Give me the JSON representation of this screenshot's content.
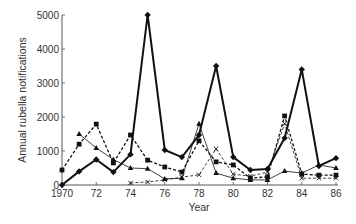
{
  "chart_data": {
    "type": "line",
    "title": "",
    "xlabel": "Year",
    "ylabel": "Annual rubella notifications",
    "xlim": [
      1970,
      1986
    ],
    "ylim": [
      0,
      5000
    ],
    "x_ticks": [
      1970,
      1972,
      1974,
      1976,
      1978,
      1980,
      1982,
      1984,
      1986
    ],
    "x_tick_labels": [
      "1970",
      "72",
      "74",
      "76",
      "78",
      "80",
      "82",
      "84",
      "86"
    ],
    "y_ticks": [
      0,
      1000,
      2000,
      3000,
      4000,
      5000
    ],
    "y_tick_labels": [
      "0",
      "1000",
      "2000",
      "3000",
      "4000",
      "5000"
    ],
    "grid": false,
    "legend": null,
    "x": [
      1970,
      1971,
      1972,
      1973,
      1974,
      1975,
      1976,
      1977,
      1978,
      1979,
      1980,
      1981,
      1982,
      1983,
      1984,
      1985,
      1986
    ],
    "series": [
      {
        "name": "diamond-solid-thick",
        "marker": "diamond",
        "line": "solid",
        "width": 2.0,
        "values": [
          0,
          400,
          750,
          380,
          900,
          5000,
          1030,
          820,
          1470,
          3500,
          820,
          440,
          470,
          1380,
          3400,
          560,
          790
        ]
      },
      {
        "name": "square-dashed",
        "marker": "square",
        "line": "dashed",
        "width": 1.3,
        "values": [
          440,
          1200,
          1790,
          650,
          1470,
          730,
          530,
          380,
          1300,
          680,
          590,
          200,
          240,
          2030,
          320,
          290,
          290
        ]
      },
      {
        "name": "triangle-solid-thin",
        "marker": "triangle",
        "line": "solid",
        "width": 0.8,
        "values": [
          null,
          1500,
          1090,
          750,
          500,
          480,
          180,
          200,
          1800,
          350,
          200,
          150,
          150,
          410,
          350,
          590,
          500
        ]
      },
      {
        "name": "cross-dashed-thin",
        "marker": "cross",
        "line": "dashed",
        "width": 0.8,
        "values": [
          null,
          null,
          null,
          null,
          60,
          90,
          150,
          230,
          300,
          1060,
          320,
          260,
          380,
          1800,
          200,
          200,
          200
        ]
      }
    ]
  },
  "colors": {
    "series": "#111111",
    "axis": "#555555",
    "text": "#333333"
  }
}
